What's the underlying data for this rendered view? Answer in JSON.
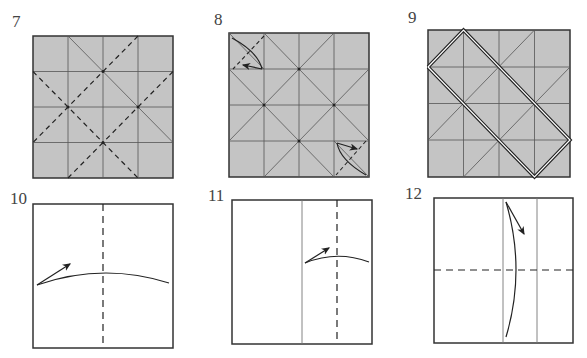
{
  "diagram": {
    "type": "origami-instructions",
    "colors": {
      "paper_colored": "#c4c4c4",
      "paper_white": "#ffffff",
      "line": "#333333",
      "thin_line": "#777777"
    },
    "steps": [
      {
        "number": "7",
        "paper": "colored",
        "grid": "4x4",
        "description": "Valley-fold diagonals (dashed) on square creased with 4x4 grid and one diagonal"
      },
      {
        "number": "8",
        "paper": "colored",
        "grid": "4x4",
        "description": "Fold two opposite corners in along dashed lines"
      },
      {
        "number": "9",
        "paper": "colored",
        "grid": "4x4",
        "description": "Result: corners folded, diagonal pleats shown with double lines"
      },
      {
        "number": "10",
        "paper": "white",
        "description": "Valley-fold in half vertically"
      },
      {
        "number": "11",
        "paper": "white",
        "description": "Fold right flap to the center"
      },
      {
        "number": "12",
        "paper": "white",
        "description": "Valley-fold in half horizontally"
      }
    ]
  }
}
